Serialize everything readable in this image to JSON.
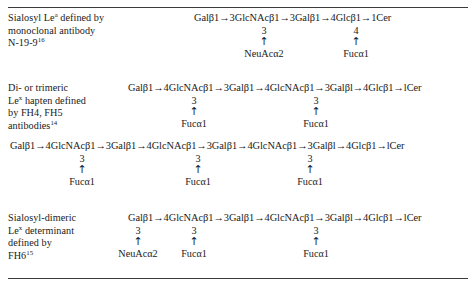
{
  "document": {
    "kind": "scientific-table",
    "title": "Glycolipid structures and defining monoclonal antibodies"
  },
  "rules": {
    "top": "hairline",
    "bottom": "hairline"
  },
  "rows": [
    {
      "id": "row-sialosyl-lea",
      "description_lines": [
        {
          "text": "Sialosyl Le",
          "sup": "a",
          "tail": " defined by"
        },
        {
          "text": "monoclonal antibody",
          "sup": "",
          "tail": ""
        },
        {
          "text": "N-19-9",
          "sup": "16",
          "tail": ""
        }
      ],
      "backbone": "Galβ1→3GlcNAcβ1→3Galβ1→4Glcβ1→1Cer",
      "branches": [
        {
          "position": "3",
          "arrow": "↑",
          "sugar": "NeuAcα2",
          "x": 70
        },
        {
          "position": "4",
          "arrow": "↑",
          "sugar": "Fucα1",
          "x": 162
        }
      ]
    },
    {
      "id": "row-di-or-trimeric-lex",
      "description_lines": [
        {
          "text": "Di- or trimeric",
          "sup": "",
          "tail": ""
        },
        {
          "text": "Le",
          "sup": "x",
          "tail": " hapten defined"
        },
        {
          "text": "by FH4, FH5",
          "sup": "",
          "tail": ""
        },
        {
          "text": "antibodies",
          "sup": "14",
          "tail": ""
        }
      ],
      "backbone": "Galβ1→4GlcNAcβ1→3Galβ1→4GlcNAcβ1→3Galβl→4Glcβ1→lCer",
      "branches": [
        {
          "position": "3",
          "arrow": "↑",
          "sugar": "Fucα1",
          "x": 66
        },
        {
          "position": "3",
          "arrow": "↑",
          "sugar": "Fucα1",
          "x": 188
        }
      ]
    },
    {
      "id": "row-trimeric-lex-backbone",
      "description_lines": [],
      "backbone": "Galβ1→4GlcNAcβ1→3Galβ1→4GlcNAcβ1→3Galβ1→4GlcNAcβ1→3Galβl→4Glcβ1→lCer",
      "branches": [
        {
          "position": "3",
          "arrow": "↑",
          "sugar": "Fucα1",
          "x": 72
        },
        {
          "position": "3",
          "arrow": "↑",
          "sugar": "Fucα1",
          "x": 188
        },
        {
          "position": "3",
          "arrow": "↑",
          "sugar": "Fucα1",
          "x": 300
        }
      ]
    },
    {
      "id": "row-sialosyl-dimeric-lex",
      "description_lines": [
        {
          "text": "Sialosyl-dimeric",
          "sup": "",
          "tail": ""
        },
        {
          "text": "Le",
          "sup": "x",
          "tail": " determinant"
        },
        {
          "text": "defined by",
          "sup": "",
          "tail": ""
        },
        {
          "text": "FH6",
          "sup": "15",
          "tail": ""
        }
      ],
      "backbone": "Galβ1→4GlcNAcβ1→3Galβ1→4GlcNAcβ1→3Galβl→4Glcβ1→lCer",
      "branches": [
        {
          "position": "3",
          "arrow": "↑",
          "sugar": "NeuAcα2",
          "x": 10
        },
        {
          "position": "3",
          "arrow": "↑",
          "sugar": "Fucα1",
          "x": 66
        },
        {
          "position": "3",
          "arrow": "↑",
          "sugar": "Fucα1",
          "x": 188
        }
      ]
    }
  ],
  "layout": {
    "row_tops": [
      12,
      82,
      140,
      212
    ],
    "branch_offsets": [
      14,
      14,
      14,
      14
    ],
    "formula_left": [
      192,
      126,
      8,
      126
    ]
  },
  "colors": {
    "text": "#1a1a1a",
    "rule": "#3a3a3a",
    "background": "#ffffff"
  }
}
